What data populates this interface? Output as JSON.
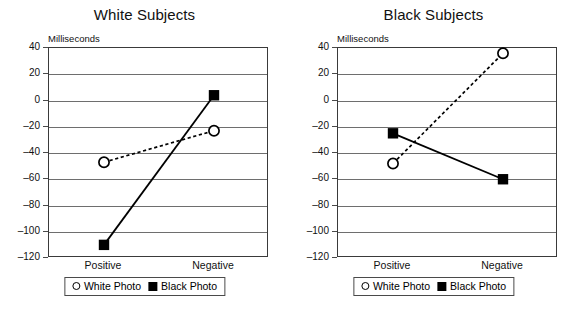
{
  "figure": {
    "axis_unit_label": "Milliseconds",
    "legend": {
      "white_photo_label": "White Photo",
      "black_photo_label": "Black Photo",
      "white_marker_icon": "open-circle-marker",
      "black_marker_icon": "filled-square-marker"
    }
  },
  "chart_data": [
    {
      "type": "line",
      "title": "White Subjects",
      "xlabel": "",
      "ylabel": "Milliseconds",
      "categories": [
        "Positive",
        "Negative"
      ],
      "x_tick_labels": [
        "Positive",
        "Negative"
      ],
      "y_tick_labels": [
        "40",
        "20",
        "0",
        "–20",
        "–40",
        "–60",
        "–80",
        "–100",
        "–120"
      ],
      "y_ticks": [
        40,
        20,
        0,
        -20,
        -40,
        -60,
        -80,
        -100,
        -120
      ],
      "ylim": [
        -120,
        40
      ],
      "grid": true,
      "legend_position": "below-axes",
      "series": [
        {
          "name": "White Photo",
          "marker": "open-circle",
          "line_style": "dotted",
          "values": [
            -47,
            -23
          ]
        },
        {
          "name": "Black Photo",
          "marker": "filled-square",
          "line_style": "solid",
          "values": [
            -110,
            4
          ]
        }
      ]
    },
    {
      "type": "line",
      "title": "Black Subjects",
      "xlabel": "",
      "ylabel": "Milliseconds",
      "categories": [
        "Positive",
        "Negative"
      ],
      "x_tick_labels": [
        "Positive",
        "Negative"
      ],
      "y_tick_labels": [
        "40",
        "20",
        "0",
        "–20",
        "–40",
        "–60",
        "–80",
        "–100",
        "–120"
      ],
      "y_ticks": [
        40,
        20,
        0,
        -20,
        -40,
        -60,
        -80,
        -100,
        -120
      ],
      "ylim": [
        -120,
        40
      ],
      "grid": true,
      "legend_position": "below-axes",
      "series": [
        {
          "name": "White Photo",
          "marker": "open-circle",
          "line_style": "dotted",
          "values": [
            -48,
            36
          ]
        },
        {
          "name": "Black Photo",
          "marker": "filled-square",
          "line_style": "solid",
          "values": [
            -25,
            -60
          ]
        }
      ]
    }
  ],
  "colors": {
    "line": "#000000",
    "grid": "#6e6e6e",
    "frame": "#3a3a3a",
    "background": "#ffffff",
    "text": "#111111"
  }
}
